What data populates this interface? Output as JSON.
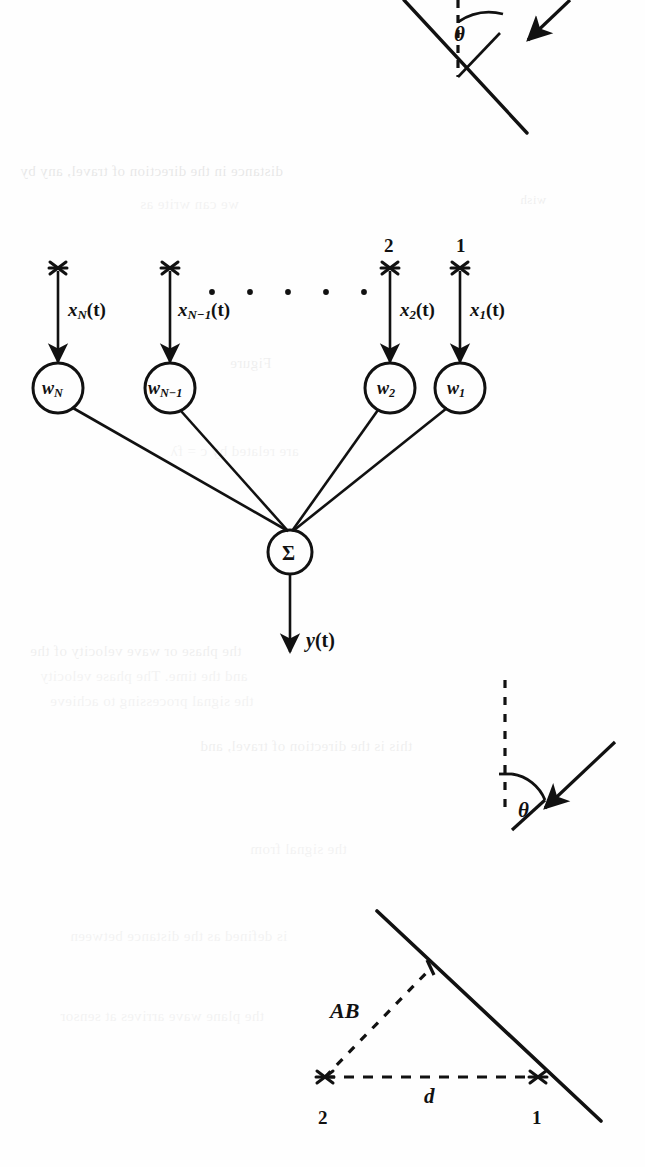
{
  "page": {
    "width": 645,
    "height": 1167,
    "background_color": "#fefefe",
    "ink_color": "#111111"
  },
  "network_diagram": {
    "name": "adaptive-linear-combiner",
    "input_markers": [
      {
        "label": "N",
        "shown": false
      },
      {
        "label": "N-1",
        "shown": false
      },
      {
        "label": "2",
        "shown": true
      },
      {
        "label": "1",
        "shown": true
      }
    ],
    "sensor_numbers": {
      "sensor_2": "2",
      "sensor_1": "1"
    },
    "input_signals": [
      {
        "symbol": "x",
        "subscript": "N",
        "arg": "(t)",
        "text": "x_N(t)"
      },
      {
        "symbol": "x",
        "subscript": "N-1",
        "arg": "(t)",
        "text": "x_N-1(t)"
      },
      {
        "symbol": "x",
        "subscript": "2",
        "arg": "(t)",
        "text": "x_2(t)"
      },
      {
        "symbol": "x",
        "subscript": "1",
        "arg": "(t)",
        "text": "x_1(t)"
      }
    ],
    "weights": [
      {
        "symbol": "w",
        "subscript": "N",
        "text": "w_N"
      },
      {
        "symbol": "w",
        "subscript": "N-1",
        "text": "w_N-1"
      },
      {
        "symbol": "w",
        "subscript": "2",
        "text": "w_2"
      },
      {
        "symbol": "w",
        "subscript": "1",
        "text": "w_1"
      }
    ],
    "ellipsis_dots": 5,
    "summation_node": {
      "symbol": "Σ",
      "name": "sigma"
    },
    "output_signal": {
      "symbol": "y",
      "arg": "(t)",
      "text": "y(t)"
    }
  },
  "geometry_top": {
    "name": "wavefront-angle-top",
    "angle_label": "θ",
    "has_dashed_normal": true,
    "has_incoming_arrow": true,
    "has_wavefront_line": true
  },
  "geometry_middle": {
    "name": "wavefront-angle-middle",
    "angle_label": "θ",
    "has_dashed_normal": true,
    "has_incoming_arrow": true
  },
  "geometry_bottom": {
    "name": "path-difference-diagram",
    "hypotenuse_label": "AB",
    "baseline_label": "d",
    "point_left_label": "2",
    "point_right_label": "1",
    "has_solid_wavefront": true,
    "has_dashed_triangle": true
  },
  "bleed_through_text": {
    "note": "Faint mirrored text showing through from the reverse side of the page",
    "lines": [
      "distance in the direction of travel, any by",
      "wish",
      "we can write as",
      "the phase or wave velocity of the",
      "and the time. The phase velocity",
      "the signal processing to achieve",
      "are related by c = fλ",
      "this is the direction of travel, and",
      "the signal from",
      "Figure",
      "is defined as the distance between",
      "the plane wave arrives at sensor"
    ]
  }
}
